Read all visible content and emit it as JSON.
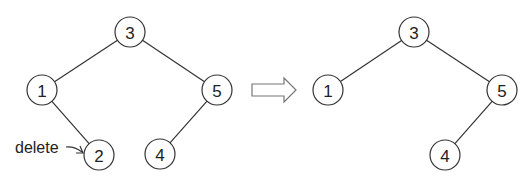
{
  "diagram": {
    "type": "bst-deletion",
    "before": {
      "nodes": [
        {
          "id": "b3",
          "label": "3",
          "x": 130,
          "y": 32
        },
        {
          "id": "b1",
          "label": "1",
          "x": 42,
          "y": 90
        },
        {
          "id": "b5",
          "label": "5",
          "x": 217,
          "y": 90
        },
        {
          "id": "b2",
          "label": "2",
          "x": 99,
          "y": 155
        },
        {
          "id": "b4",
          "label": "4",
          "x": 160,
          "y": 154
        }
      ],
      "edges": [
        [
          "b3",
          "b1"
        ],
        [
          "b3",
          "b5"
        ],
        [
          "b1",
          "b2"
        ],
        [
          "b5",
          "b4"
        ]
      ],
      "annotation": {
        "text": "delete",
        "target": "b2"
      }
    },
    "transition_arrow": "right-hollow-arrow",
    "after": {
      "nodes": [
        {
          "id": "a3",
          "label": "3",
          "x": 414,
          "y": 32
        },
        {
          "id": "a1",
          "label": "1",
          "x": 328,
          "y": 90
        },
        {
          "id": "a5",
          "label": "5",
          "x": 502,
          "y": 90
        },
        {
          "id": "a4",
          "label": "4",
          "x": 445,
          "y": 155
        }
      ],
      "edges": [
        [
          "a3",
          "a1"
        ],
        [
          "a3",
          "a5"
        ],
        [
          "a5",
          "a4"
        ]
      ]
    },
    "node_radius": 15
  }
}
